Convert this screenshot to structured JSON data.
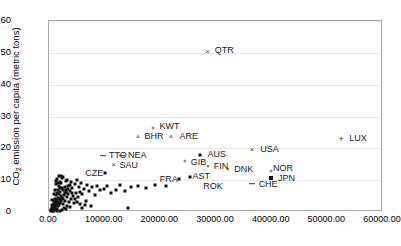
{
  "chart_data": {
    "type": "scatter",
    "title": "",
    "xlabel": "",
    "ylabel": "CO2 emission per capita (metric tons)",
    "ylabel_html": "CO<sub>2</sub> emission per capita (metric tons)",
    "xlim": [
      0,
      60000
    ],
    "ylim": [
      0,
      60
    ],
    "grid": true,
    "legend": "none",
    "xticks": [
      0,
      10000,
      20000,
      30000,
      40000,
      50000,
      60000
    ],
    "xtick_labels": [
      "0.00",
      "10000.00",
      "20000.00",
      "30000.00",
      "40000.00",
      "50000.00",
      "60000.00"
    ],
    "yticks": [
      0,
      10,
      20,
      30,
      40,
      50,
      60
    ],
    "ytick_labels": [
      "0",
      "10",
      "20",
      "30",
      "40",
      "50",
      "60"
    ],
    "labeled_points": [
      {
        "label": "QTR",
        "x": 28500,
        "y": 50.2,
        "marker": "cross",
        "label_dx": 7,
        "label_dy": -1
      },
      {
        "label": "LUX",
        "x": 52500,
        "y": 22.8,
        "marker": "plus",
        "label_dx": 8,
        "label_dy": 0
      },
      {
        "label": "USA",
        "x": 36500,
        "y": 19.5,
        "marker": "cross",
        "label_dx": 8,
        "label_dy": 0
      },
      {
        "label": "KWT",
        "x": 18600,
        "y": 26.5,
        "marker": "dotgray",
        "label_dx": 7,
        "label_dy": -1
      },
      {
        "label": "BHR",
        "x": 15900,
        "y": 24.0,
        "marker": "tri",
        "label_dx": 7,
        "label_dy": 1
      },
      {
        "label": "ARE",
        "x": 22000,
        "y": 23.8,
        "marker": "tri",
        "label_dx": 8,
        "label_dy": 1
      },
      {
        "label": "AUS",
        "x": 27200,
        "y": 17.8,
        "marker": "dot",
        "label_dx": 7,
        "label_dy": 0
      },
      {
        "label": "GIB",
        "x": 24400,
        "y": 16.0,
        "marker": "dotgray",
        "label_dx": 6,
        "label_dy": 2
      },
      {
        "label": "FIN",
        "x": 28500,
        "y": 14.4,
        "marker": "dotgray",
        "label_dx": 6,
        "label_dy": 1
      },
      {
        "label": "TTO",
        "x": 9700,
        "y": 17.7,
        "marker": "dash",
        "label_dx": 6,
        "label_dy": 0
      },
      {
        "label": "NEA",
        "x": 13100,
        "y": 17.7,
        "marker": "dash",
        "label_dx": 6,
        "label_dy": 0
      },
      {
        "label": "SAU",
        "x": 11600,
        "y": 14.8,
        "marker": "cross",
        "label_dx": 6,
        "label_dy": 1
      },
      {
        "label": "CZE",
        "x": 10100,
        "y": 12.3,
        "marker": "dot",
        "label_dx": -20,
        "label_dy": 1
      },
      {
        "label": "DNK",
        "x": 32200,
        "y": 13.6,
        "marker": "dotgray",
        "label_dx": 6,
        "label_dy": 1
      },
      {
        "label": "NOR",
        "x": 39900,
        "y": 13.0,
        "marker": "dotgray",
        "label_dx": 2,
        "label_dy": -2
      },
      {
        "label": "JPN",
        "x": 39900,
        "y": 10.6,
        "marker": "sq",
        "label_dx": 7,
        "label_dy": 1
      },
      {
        "label": "CHE",
        "x": 36400,
        "y": 8.9,
        "marker": "dash",
        "label_dx": 7,
        "label_dy": 1
      },
      {
        "label": "FRA",
        "x": 23300,
        "y": 10.3,
        "marker": "dot",
        "label_dx": -19,
        "label_dy": 1
      },
      {
        "label": "AST",
        "x": 25400,
        "y": 10.9,
        "marker": "dot",
        "label_dx": 2,
        "label_dy": 0
      },
      {
        "label": "ROK",
        "x": 27700,
        "y": 7.7,
        "marker": "none",
        "label_dx": 0,
        "label_dy": 0
      }
    ],
    "unlabeled_points": [
      {
        "x": 300,
        "y": 0.2
      },
      {
        "x": 420,
        "y": 0.5
      },
      {
        "x": 500,
        "y": 0.9
      },
      {
        "x": 600,
        "y": 1.3
      },
      {
        "x": 650,
        "y": 0.4
      },
      {
        "x": 700,
        "y": 2.0
      },
      {
        "x": 760,
        "y": 1.1
      },
      {
        "x": 820,
        "y": 0.6
      },
      {
        "x": 880,
        "y": 2.6
      },
      {
        "x": 900,
        "y": 1.7
      },
      {
        "x": 950,
        "y": 3.4
      },
      {
        "x": 1000,
        "y": 0.8
      },
      {
        "x": 1050,
        "y": 2.2
      },
      {
        "x": 1100,
        "y": 4.1
      },
      {
        "x": 1150,
        "y": 1.5
      },
      {
        "x": 1200,
        "y": 3.0
      },
      {
        "x": 1250,
        "y": 5.2
      },
      {
        "x": 1300,
        "y": 2.4
      },
      {
        "x": 1350,
        "y": 1.0
      },
      {
        "x": 1400,
        "y": 3.8
      },
      {
        "x": 1450,
        "y": 6.0
      },
      {
        "x": 1500,
        "y": 2.8
      },
      {
        "x": 1550,
        "y": 4.5
      },
      {
        "x": 1600,
        "y": 1.9
      },
      {
        "x": 1650,
        "y": 7.0
      },
      {
        "x": 1700,
        "y": 3.2
      },
      {
        "x": 1750,
        "y": 5.6
      },
      {
        "x": 1800,
        "y": 2.1
      },
      {
        "x": 1850,
        "y": 8.2
      },
      {
        "x": 1900,
        "y": 4.0
      },
      {
        "x": 1950,
        "y": 6.4
      },
      {
        "x": 2000,
        "y": 2.9
      },
      {
        "x": 2100,
        "y": 9.1
      },
      {
        "x": 2150,
        "y": 5.0
      },
      {
        "x": 2200,
        "y": 3.6
      },
      {
        "x": 2250,
        "y": 7.6
      },
      {
        "x": 2300,
        "y": 10.8
      },
      {
        "x": 2400,
        "y": 4.4
      },
      {
        "x": 2450,
        "y": 6.8
      },
      {
        "x": 2500,
        "y": 2.5
      },
      {
        "x": 2600,
        "y": 11.0
      },
      {
        "x": 2700,
        "y": 5.4
      },
      {
        "x": 2800,
        "y": 8.0
      },
      {
        "x": 2900,
        "y": 3.3
      },
      {
        "x": 3000,
        "y": 9.6
      },
      {
        "x": 3100,
        "y": 6.2
      },
      {
        "x": 3200,
        "y": 4.8
      },
      {
        "x": 3300,
        "y": 10.2
      },
      {
        "x": 3400,
        "y": 7.2
      },
      {
        "x": 3500,
        "y": 5.8
      },
      {
        "x": 3600,
        "y": 3.1
      },
      {
        "x": 3700,
        "y": 8.6
      },
      {
        "x": 3800,
        "y": 6.6
      },
      {
        "x": 3900,
        "y": 4.2
      },
      {
        "x": 4000,
        "y": 9.3
      },
      {
        "x": 4200,
        "y": 7.4
      },
      {
        "x": 4400,
        "y": 5.1
      },
      {
        "x": 4600,
        "y": 8.8
      },
      {
        "x": 4800,
        "y": 6.0
      },
      {
        "x": 5000,
        "y": 10.0
      },
      {
        "x": 5200,
        "y": 4.6
      },
      {
        "x": 5400,
        "y": 7.8
      },
      {
        "x": 5600,
        "y": 6.3
      },
      {
        "x": 5800,
        "y": 9.0
      },
      {
        "x": 6000,
        "y": 5.5
      },
      {
        "x": 6300,
        "y": 7.1
      },
      {
        "x": 6600,
        "y": 3.5
      },
      {
        "x": 6900,
        "y": 8.4
      },
      {
        "x": 7200,
        "y": 6.7
      },
      {
        "x": 7500,
        "y": 1.8
      },
      {
        "x": 7800,
        "y": 7.9
      },
      {
        "x": 8200,
        "y": 5.3
      },
      {
        "x": 8700,
        "y": 8.1
      },
      {
        "x": 9200,
        "y": 6.9
      },
      {
        "x": 9800,
        "y": 7.3
      },
      {
        "x": 10500,
        "y": 8.3
      },
      {
        "x": 11200,
        "y": 5.9
      },
      {
        "x": 12000,
        "y": 7.0
      },
      {
        "x": 12800,
        "y": 8.5
      },
      {
        "x": 13600,
        "y": 6.5
      },
      {
        "x": 14200,
        "y": 1.2
      },
      {
        "x": 14800,
        "y": 8.0
      },
      {
        "x": 16000,
        "y": 8.2
      },
      {
        "x": 17500,
        "y": 7.6
      },
      {
        "x": 19000,
        "y": 8.4
      },
      {
        "x": 21000,
        "y": 8.1
      },
      {
        "x": 1250,
        "y": 9.8
      },
      {
        "x": 1500,
        "y": 10.4
      },
      {
        "x": 1750,
        "y": 11.2
      },
      {
        "x": 2050,
        "y": 7.5
      },
      {
        "x": 900,
        "y": 5.7
      },
      {
        "x": 1100,
        "y": 6.9
      },
      {
        "x": 1300,
        "y": 8.7
      },
      {
        "x": 600,
        "y": 3.9
      },
      {
        "x": 480,
        "y": 2.3
      },
      {
        "x": 3300,
        "y": 2.0
      },
      {
        "x": 3800,
        "y": 1.6
      },
      {
        "x": 4500,
        "y": 2.7
      },
      {
        "x": 5100,
        "y": 3.0
      },
      {
        "x": 5900,
        "y": 1.4
      },
      {
        "x": 6400,
        "y": 2.2
      },
      {
        "x": 2400,
        "y": 0.7
      },
      {
        "x": 1900,
        "y": 0.4
      },
      {
        "x": 1400,
        "y": 0.3
      },
      {
        "x": 800,
        "y": 0.2
      },
      {
        "x": 2700,
        "y": 1.2
      },
      {
        "x": 3100,
        "y": 0.9
      },
      {
        "x": 4100,
        "y": 6.1
      },
      {
        "x": 4700,
        "y": 4.0
      },
      {
        "x": 5500,
        "y": 2.6
      },
      {
        "x": 2850,
        "y": 5.9
      },
      {
        "x": 3450,
        "y": 8.2
      },
      {
        "x": 2000,
        "y": 9.5
      },
      {
        "x": 1650,
        "y": 9.0
      },
      {
        "x": 2200,
        "y": 11.3
      },
      {
        "x": 2550,
        "y": 4.1
      },
      {
        "x": 3050,
        "y": 7.0
      }
    ]
  }
}
